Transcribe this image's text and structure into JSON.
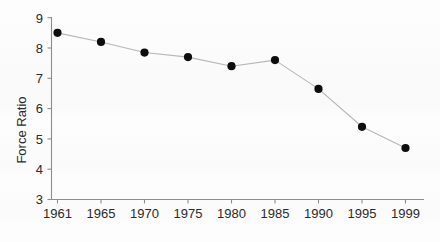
{
  "chart_data": {
    "type": "line",
    "title": "",
    "xlabel": "",
    "ylabel": "Force Ratio",
    "categories": [
      "1961",
      "1965",
      "1970",
      "1975",
      "1980",
      "1985",
      "1990",
      "1995",
      "1999"
    ],
    "values": [
      8.5,
      8.2,
      7.85,
      7.7,
      7.4,
      7.6,
      6.65,
      5.4,
      4.7
    ],
    "series": [
      {
        "name": "Force Ratio",
        "values": [
          8.5,
          8.2,
          7.85,
          7.7,
          7.4,
          7.6,
          6.65,
          5.4,
          4.7
        ]
      }
    ],
    "ylim": [
      3,
      9
    ],
    "yticks": [
      3,
      4,
      5,
      6,
      7,
      8,
      9
    ],
    "ytick_labels": [
      "3",
      "4",
      "5",
      "6",
      "7",
      "8",
      "9"
    ],
    "xtick_labels": [
      "1961",
      "1965",
      "1970",
      "1975",
      "1980",
      "1985",
      "1990",
      "1995",
      "1999"
    ],
    "grid": false,
    "legend": "none",
    "marker": "filled-circle",
    "marker_color": "#0d0d0d",
    "line_color": "#b6b6b6",
    "axis_color": "#8d8d8d",
    "background_color": "#fdfdfd"
  },
  "axes": {
    "y_title": "Force Ratio"
  }
}
